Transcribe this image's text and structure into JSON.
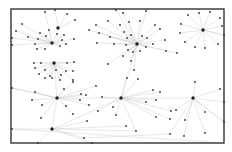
{
  "diagram": {
    "type": "network-graph",
    "frame": {
      "x": 11,
      "y": 9,
      "width": 213,
      "height": 134
    },
    "colors": {
      "frame": "#333333",
      "edge": "#cfcfcf",
      "node": "#333333",
      "hub": "#222222"
    },
    "hubs": [
      {
        "id": "h1",
        "x": 52,
        "y": 43
      },
      {
        "id": "h2",
        "x": 137,
        "y": 44
      },
      {
        "id": "h3",
        "x": 203,
        "y": 30
      },
      {
        "id": "h4",
        "x": 54,
        "y": 63
      },
      {
        "id": "h5",
        "x": 57,
        "y": 98
      },
      {
        "id": "h6",
        "x": 121,
        "y": 98
      },
      {
        "id": "h7",
        "x": 193,
        "y": 98
      },
      {
        "id": "h8",
        "x": 52,
        "y": 129
      },
      {
        "id": "h9",
        "x": 58,
        "y": 28
      }
    ],
    "nodes": [
      {
        "x": 45,
        "y": 12,
        "hub": "h1"
      },
      {
        "x": 55,
        "y": 10,
        "hub": "h9"
      },
      {
        "x": 67,
        "y": 14,
        "hub": "h9"
      },
      {
        "x": 75,
        "y": 20,
        "hub": "h9"
      },
      {
        "x": 22,
        "y": 24,
        "hub": "h1"
      },
      {
        "x": 16,
        "y": 31,
        "hub": "h1"
      },
      {
        "x": 28,
        "y": 37,
        "hub": "h1"
      },
      {
        "x": 12,
        "y": 38,
        "hub": "h1"
      },
      {
        "x": 40,
        "y": 33,
        "hub": "h1"
      },
      {
        "x": 46,
        "y": 36,
        "hub": "h1"
      },
      {
        "x": 49,
        "y": 30,
        "hub": "h1"
      },
      {
        "x": 57,
        "y": 34,
        "hub": "h1"
      },
      {
        "x": 64,
        "y": 35,
        "hub": "h1"
      },
      {
        "x": 62,
        "y": 40,
        "hub": "h1"
      },
      {
        "x": 38,
        "y": 39,
        "hub": "h1"
      },
      {
        "x": 35,
        "y": 44,
        "hub": "h1"
      },
      {
        "x": 37,
        "y": 49,
        "hub": "h1"
      },
      {
        "x": 45,
        "y": 49,
        "hub": "h1"
      },
      {
        "x": 60,
        "y": 46,
        "hub": "h1"
      },
      {
        "x": 66,
        "y": 44,
        "hub": "h1"
      },
      {
        "x": 74,
        "y": 39,
        "hub": "h1"
      },
      {
        "x": 12,
        "y": 45,
        "hub": "h1"
      },
      {
        "x": 89,
        "y": 30,
        "hub": "h2"
      },
      {
        "x": 96,
        "y": 25,
        "hub": "h2"
      },
      {
        "x": 108,
        "y": 21,
        "hub": "h2"
      },
      {
        "x": 116,
        "y": 10,
        "hub": "h2"
      },
      {
        "x": 123,
        "y": 13,
        "hub": "h2"
      },
      {
        "x": 120,
        "y": 25,
        "hub": "h2"
      },
      {
        "x": 129,
        "y": 22,
        "hub": "h2"
      },
      {
        "x": 140,
        "y": 21,
        "hub": "h2"
      },
      {
        "x": 146,
        "y": 11,
        "hub": "h2"
      },
      {
        "x": 155,
        "y": 25,
        "hub": "h2"
      },
      {
        "x": 160,
        "y": 29,
        "hub": "h2"
      },
      {
        "x": 124,
        "y": 32,
        "hub": "h2"
      },
      {
        "x": 110,
        "y": 37,
        "hub": "h2"
      },
      {
        "x": 99,
        "y": 33,
        "hub": "h2"
      },
      {
        "x": 97,
        "y": 43,
        "hub": "h2"
      },
      {
        "x": 127,
        "y": 38,
        "hub": "h2"
      },
      {
        "x": 131,
        "y": 35,
        "hub": "h2"
      },
      {
        "x": 142,
        "y": 36,
        "hub": "h2"
      },
      {
        "x": 147,
        "y": 38,
        "hub": "h2"
      },
      {
        "x": 126,
        "y": 45,
        "hub": "h2"
      },
      {
        "x": 128,
        "y": 50,
        "hub": "h2"
      },
      {
        "x": 133,
        "y": 52,
        "hub": "h2"
      },
      {
        "x": 140,
        "y": 51,
        "hub": "h2"
      },
      {
        "x": 146,
        "y": 47,
        "hub": "h2"
      },
      {
        "x": 153,
        "y": 44,
        "hub": "h2"
      },
      {
        "x": 165,
        "y": 40,
        "hub": "h2"
      },
      {
        "x": 166,
        "y": 51,
        "hub": "h2"
      },
      {
        "x": 177,
        "y": 53,
        "hub": "h2"
      },
      {
        "x": 123,
        "y": 56,
        "hub": "h2"
      },
      {
        "x": 131,
        "y": 61,
        "hub": "h2"
      },
      {
        "x": 108,
        "y": 64,
        "hub": "h2"
      },
      {
        "x": 134,
        "y": 70,
        "hub": "h2"
      },
      {
        "x": 114,
        "y": 44,
        "hub": "h2"
      },
      {
        "x": 199,
        "y": 13,
        "hub": "h3"
      },
      {
        "x": 210,
        "y": 12,
        "hub": "h3"
      },
      {
        "x": 188,
        "y": 15,
        "hub": "h3"
      },
      {
        "x": 220,
        "y": 18,
        "hub": "h3"
      },
      {
        "x": 181,
        "y": 24,
        "hub": "h3"
      },
      {
        "x": 222,
        "y": 26,
        "hub": "h3"
      },
      {
        "x": 180,
        "y": 33,
        "hub": "h3"
      },
      {
        "x": 224,
        "y": 35,
        "hub": "h3"
      },
      {
        "x": 218,
        "y": 44,
        "hub": "h3"
      },
      {
        "x": 185,
        "y": 42,
        "hub": "h3"
      },
      {
        "x": 195,
        "y": 47,
        "hub": "h3"
      },
      {
        "x": 205,
        "y": 48,
        "hub": "h3"
      },
      {
        "x": 34,
        "y": 63,
        "hub": "h4"
      },
      {
        "x": 41,
        "y": 63,
        "hub": "h4"
      },
      {
        "x": 67,
        "y": 63,
        "hub": "h4"
      },
      {
        "x": 74,
        "y": 62,
        "hub": "h4"
      },
      {
        "x": 35,
        "y": 68,
        "hub": "h4"
      },
      {
        "x": 45,
        "y": 70,
        "hub": "h4"
      },
      {
        "x": 56,
        "y": 70,
        "hub": "h4"
      },
      {
        "x": 66,
        "y": 71,
        "hub": "h4"
      },
      {
        "x": 73,
        "y": 71,
        "hub": "h4"
      },
      {
        "x": 39,
        "y": 74,
        "hub": "h4"
      },
      {
        "x": 50,
        "y": 76,
        "hub": "h4"
      },
      {
        "x": 61,
        "y": 75,
        "hub": "h4"
      },
      {
        "x": 45,
        "y": 78,
        "hub": "h4"
      },
      {
        "x": 52,
        "y": 78,
        "hub": "h4"
      },
      {
        "x": 60,
        "y": 80,
        "hub": "h4"
      },
      {
        "x": 73,
        "y": 80,
        "hub": "h4"
      },
      {
        "x": 12,
        "y": 88,
        "hub": "h5"
      },
      {
        "x": 35,
        "y": 92,
        "hub": "h5"
      },
      {
        "x": 32,
        "y": 100,
        "hub": "h5"
      },
      {
        "x": 42,
        "y": 105,
        "hub": "h5"
      },
      {
        "x": 41,
        "y": 118,
        "hub": "h5"
      },
      {
        "x": 66,
        "y": 106,
        "hub": "h5"
      },
      {
        "x": 73,
        "y": 114,
        "hub": "h5"
      },
      {
        "x": 64,
        "y": 89,
        "hub": "h5"
      },
      {
        "x": 73,
        "y": 82,
        "hub": "h5"
      },
      {
        "x": 81,
        "y": 94,
        "hub": "h5"
      },
      {
        "x": 86,
        "y": 95,
        "hub": "h5"
      },
      {
        "x": 80,
        "y": 100,
        "hub": "h5"
      },
      {
        "x": 89,
        "y": 105,
        "hub": "h5"
      },
      {
        "x": 96,
        "y": 86,
        "hub": "h5"
      },
      {
        "x": 127,
        "y": 78,
        "hub": "h6"
      },
      {
        "x": 138,
        "y": 79,
        "hub": "h6"
      },
      {
        "x": 153,
        "y": 90,
        "hub": "h6"
      },
      {
        "x": 160,
        "y": 92,
        "hub": "h6"
      },
      {
        "x": 156,
        "y": 100,
        "hub": "h6"
      },
      {
        "x": 146,
        "y": 102,
        "hub": "h6"
      },
      {
        "x": 102,
        "y": 97,
        "hub": "h6"
      },
      {
        "x": 113,
        "y": 107,
        "hub": "h6"
      },
      {
        "x": 98,
        "y": 111,
        "hub": "h6"
      },
      {
        "x": 116,
        "y": 115,
        "hub": "h6"
      },
      {
        "x": 156,
        "y": 117,
        "hub": "h6"
      },
      {
        "x": 171,
        "y": 111,
        "hub": "h6"
      },
      {
        "x": 170,
        "y": 119,
        "hub": "h6"
      },
      {
        "x": 195,
        "y": 82,
        "hub": "h7"
      },
      {
        "x": 220,
        "y": 89,
        "hub": "h7"
      },
      {
        "x": 224,
        "y": 102,
        "hub": "h7"
      },
      {
        "x": 205,
        "y": 112,
        "hub": "h7"
      },
      {
        "x": 176,
        "y": 110,
        "hub": "h7"
      },
      {
        "x": 185,
        "y": 120,
        "hub": "h7"
      },
      {
        "x": 224,
        "y": 122,
        "hub": "h7"
      },
      {
        "x": 170,
        "y": 134,
        "hub": "h7"
      },
      {
        "x": 184,
        "y": 136,
        "hub": "h7"
      },
      {
        "x": 205,
        "y": 133,
        "hub": "h7"
      },
      {
        "x": 12,
        "y": 129,
        "hub": "h8"
      },
      {
        "x": 38,
        "y": 143,
        "hub": "h8"
      },
      {
        "x": 92,
        "y": 143,
        "hub": "h8"
      },
      {
        "x": 84,
        "y": 138,
        "hub": "h8"
      },
      {
        "x": 87,
        "y": 121,
        "hub": "h8"
      },
      {
        "x": 136,
        "y": 131,
        "hub": "h8"
      },
      {
        "x": 126,
        "y": 126,
        "hub": "h8"
      }
    ],
    "extra_edges": [
      [
        57,
        98,
        121,
        98
      ],
      [
        121,
        98,
        193,
        98
      ],
      [
        57,
        98,
        52,
        129
      ],
      [
        52,
        129,
        121,
        98
      ],
      [
        121,
        98,
        136,
        131
      ],
      [
        193,
        98,
        224,
        122
      ],
      [
        12,
        88,
        57,
        98
      ],
      [
        137,
        44,
        121,
        98
      ],
      [
        203,
        30,
        224,
        35
      ],
      [
        54,
        63,
        57,
        98
      ],
      [
        12,
        129,
        224,
        143
      ],
      [
        84,
        138,
        170,
        134
      ]
    ]
  }
}
